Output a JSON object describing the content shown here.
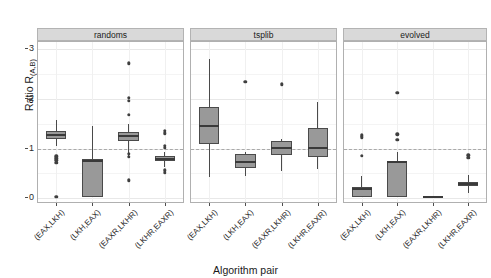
{
  "chart_data": {
    "type": "box",
    "title": "",
    "xlabel": "Algorithm pair",
    "ylabel": "Ratio R",
    "ylabel_sub": "(A,B)",
    "ylim": [
      -0.12,
      3.15
    ],
    "yticks": [
      0,
      1,
      2,
      3
    ],
    "ytick_labels": [
      "0",
      "1",
      "2",
      "3"
    ],
    "grid": true,
    "legend": "none",
    "reference_line": 1,
    "facet_labels": [
      "randoms",
      "tsplib",
      "evolved"
    ],
    "categories": [
      "(EAX,LKH)",
      "(LKH,EAX)",
      "(EAXR,LKHR)",
      "(LKHR,EAXR)"
    ],
    "panels": [
      {
        "name": "randoms",
        "boxes": [
          {
            "category": "(EAX,LKH)",
            "lower_whisker": 1.05,
            "q1": 1.2,
            "median": 1.28,
            "q3": 1.36,
            "upper_whisker": 1.58,
            "outliers": [
              0.84,
              0.8,
              0.76,
              0.71,
              0.03
            ]
          },
          {
            "category": "(LKH,EAX)",
            "lower_whisker": 0.02,
            "q1": 0.03,
            "median": 0.74,
            "q3": 0.79,
            "upper_whisker": 1.45,
            "outliers": []
          },
          {
            "category": "(EAXR,LKHR)",
            "lower_whisker": 0.82,
            "q1": 1.16,
            "median": 1.25,
            "q3": 1.33,
            "upper_whisker": 1.5,
            "outliers": [
              2.72,
              2.02,
              1.96,
              1.68,
              0.89,
              0.83,
              0.36
            ]
          },
          {
            "category": "(LKHR,EAXR)",
            "lower_whisker": 0.63,
            "q1": 0.74,
            "median": 0.79,
            "q3": 0.84,
            "upper_whisker": 0.92,
            "outliers": [
              1.36,
              1.31,
              1.06,
              1.02,
              0.56,
              0.51
            ]
          }
        ]
      },
      {
        "name": "tsplib",
        "boxes": [
          {
            "category": "(EAX,LKH)",
            "lower_whisker": 0.42,
            "q1": 1.09,
            "median": 1.46,
            "q3": 1.84,
            "upper_whisker": 2.8,
            "outliers": []
          },
          {
            "category": "(LKH,EAX)",
            "lower_whisker": 0.45,
            "q1": 0.61,
            "median": 0.72,
            "q3": 0.88,
            "upper_whisker": 0.92,
            "outliers": [
              2.35
            ]
          },
          {
            "category": "(EAXR,LKHR)",
            "lower_whisker": 0.55,
            "q1": 0.86,
            "median": 1.02,
            "q3": 1.16,
            "upper_whisker": 1.2,
            "outliers": [
              2.3
            ]
          },
          {
            "category": "(LKHR,EAXR)",
            "lower_whisker": 0.58,
            "q1": 0.82,
            "median": 1.02,
            "q3": 1.42,
            "upper_whisker": 1.93,
            "outliers": []
          }
        ]
      },
      {
        "name": "evolved",
        "boxes": [
          {
            "category": "(EAX,LKH)",
            "lower_whisker": 0.02,
            "q1": 0.03,
            "median": 0.18,
            "q3": 0.22,
            "upper_whisker": 0.44,
            "outliers": [
              1.27,
              1.23,
              0.85
            ]
          },
          {
            "category": "(LKH,EAX)",
            "lower_whisker": 0.02,
            "q1": 0.03,
            "median": 0.72,
            "q3": 0.74,
            "upper_whisker": 0.92,
            "outliers": [
              2.12,
              1.29,
              1.18
            ]
          },
          {
            "category": "(EAXR,LKHR)",
            "lower_whisker": 0.02,
            "q1": 0.02,
            "median": 0.03,
            "q3": 0.04,
            "upper_whisker": 0.04,
            "outliers": []
          },
          {
            "category": "(LKHR,EAXR)",
            "lower_whisker": 0.1,
            "q1": 0.24,
            "median": 0.29,
            "q3": 0.33,
            "upper_whisker": 0.46,
            "outliers": [
              0.86,
              0.81
            ]
          }
        ]
      }
    ]
  },
  "style": {
    "box_fill": "#999999",
    "box_stroke": "#4a4a4a",
    "strip_fill": "#d9d9d9",
    "grid_color": "#e8e8e8",
    "reference_line_color": "#a9a9a9",
    "outlier_color": "#3f3f3f"
  }
}
